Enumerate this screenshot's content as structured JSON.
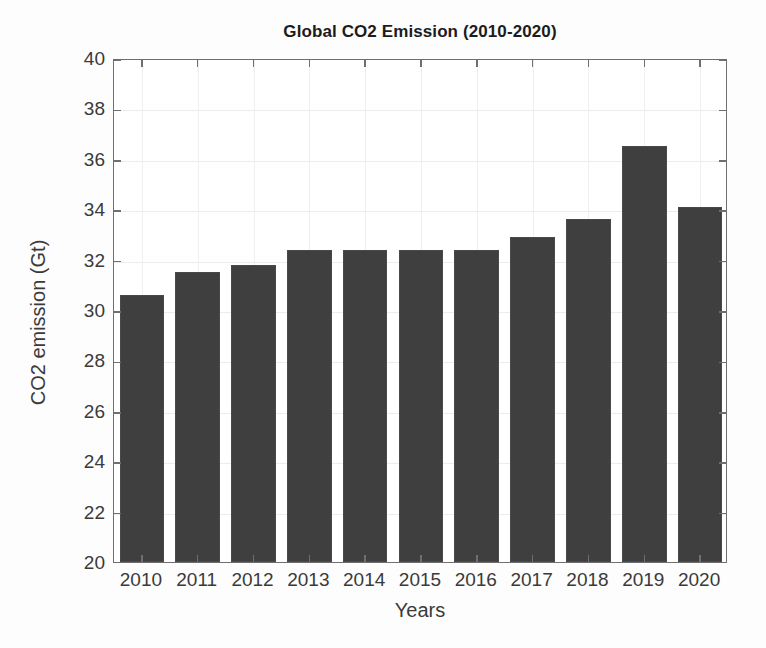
{
  "chart_data": {
    "type": "bar",
    "title": "Global CO2 Emission (2010-2020)",
    "xlabel": "Years",
    "ylabel": "CO2 emission (Gt)",
    "categories": [
      "2010",
      "2011",
      "2012",
      "2013",
      "2014",
      "2015",
      "2016",
      "2017",
      "2018",
      "2019",
      "2020"
    ],
    "values": [
      30.6,
      31.5,
      31.8,
      32.4,
      32.4,
      32.4,
      32.4,
      32.9,
      33.6,
      36.5,
      34.1
    ],
    "series": [
      {
        "name": "CO2 emission (Gt)",
        "values": [
          30.6,
          31.5,
          31.8,
          32.4,
          32.4,
          32.4,
          32.4,
          32.9,
          33.6,
          36.5,
          34.1
        ]
      }
    ],
    "ylim": [
      20,
      40
    ],
    "yticks": [
      20,
      22,
      24,
      26,
      28,
      30,
      32,
      34,
      36,
      38,
      40
    ],
    "ytick_labels": [
      "20",
      "22",
      "24",
      "26",
      "28",
      "30",
      "32",
      "34",
      "36",
      "38",
      "40"
    ],
    "xtick_labels": [
      "2010",
      "2011",
      "2012",
      "2013",
      "2014",
      "2015",
      "2016",
      "2017",
      "2018",
      "2019",
      "2020"
    ],
    "grid": true,
    "legend": null,
    "legend_position": "none",
    "bar_color": "#3f3f3f",
    "axis_color": "#6f6f6f",
    "background_color": "#ffffff"
  }
}
